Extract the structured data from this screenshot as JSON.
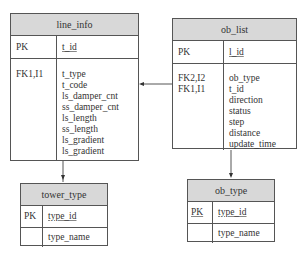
{
  "tables": {
    "line_info": {
      "title": "line_info",
      "pk_key": "PK",
      "pk_col": "t_id",
      "fk_keys": [
        "FK1,I1"
      ],
      "cols": [
        "t_type",
        "t_code",
        "ls_damper_cnt",
        "ss_damper_cnt",
        "ls_length",
        "ss_length",
        "ls_gradient",
        "ls_gradient"
      ]
    },
    "ob_list": {
      "title": "ob_list",
      "pk_key": "PK",
      "pk_col": "l_id",
      "fk_keys": [
        "FK2,I2",
        "FK1,I1"
      ],
      "cols": [
        "ob_type",
        "t_id",
        "direction",
        "status",
        "step",
        "distance",
        "update_time"
      ]
    },
    "tower_type": {
      "title": "tower_type",
      "pk_key": "PK",
      "pk_col": "type_id",
      "cols": [
        "type_name"
      ]
    },
    "ob_type": {
      "title": "ob_type",
      "pk_key": "PK",
      "pk_col": "type_id",
      "cols": [
        "type_name"
      ]
    }
  }
}
